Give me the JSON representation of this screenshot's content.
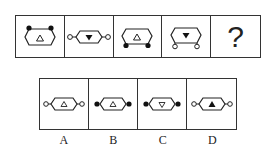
{
  "question": {
    "sequence": [
      {
        "shape": "hexagon",
        "connectors": "top",
        "connector_fill": "black",
        "inner_triangle": "up",
        "triangle_fill": "white"
      },
      {
        "shape": "hexagon",
        "connectors": "sides",
        "connector_fill": "white",
        "inner_triangle": "down",
        "triangle_fill": "black"
      },
      {
        "shape": "hexagon",
        "connectors": "bottom",
        "connector_fill": "black",
        "inner_triangle": "up",
        "triangle_fill": "white"
      },
      {
        "shape": "hexagon",
        "connectors": "bottom",
        "connector_fill": "white",
        "inner_triangle": "down",
        "triangle_fill": "black"
      }
    ],
    "missing_mark": "?"
  },
  "options": [
    {
      "label": "A",
      "connectors": "sides",
      "connector_fill": "white",
      "inner_triangle": "up",
      "triangle_fill": "white"
    },
    {
      "label": "B",
      "connectors": "sides",
      "connector_fill": "black",
      "inner_triangle": "up",
      "triangle_fill": "white"
    },
    {
      "label": "C",
      "connectors": "sides",
      "connector_fill": "black",
      "inner_triangle": "down",
      "triangle_fill": "white"
    },
    {
      "label": "D",
      "connectors": "sides",
      "connector_fill": "white",
      "inner_triangle": "up",
      "triangle_fill": "black"
    }
  ]
}
